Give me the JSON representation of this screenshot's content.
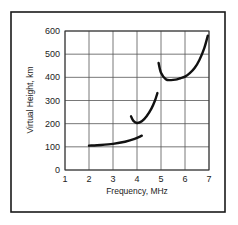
{
  "chart_data": {
    "type": "line",
    "title": "",
    "xlabel": "Frequency, MHz",
    "ylabel": "Virtual Height, km",
    "xlim": [
      1,
      7
    ],
    "ylim": [
      0,
      600
    ],
    "x_ticks": [
      "1",
      "2",
      "3",
      "4",
      "5",
      "6",
      "7"
    ],
    "y_ticks": [
      "0",
      "100",
      "200",
      "300",
      "400",
      "500",
      "600"
    ],
    "grid": true,
    "legend": null,
    "series": [
      {
        "name": "trace-1",
        "x": [
          2.0,
          2.5,
          3.0,
          3.5,
          3.9,
          4.2
        ],
        "y": [
          105,
          108,
          113,
          122,
          134,
          148
        ]
      },
      {
        "name": "trace-2",
        "x": [
          3.75,
          3.85,
          4.0,
          4.2,
          4.4,
          4.6,
          4.75,
          4.85
        ],
        "y": [
          232,
          212,
          203,
          210,
          232,
          265,
          300,
          332
        ]
      },
      {
        "name": "trace-3",
        "x": [
          4.9,
          5.0,
          5.2,
          5.4,
          5.6,
          5.8,
          6.0,
          6.2,
          6.4,
          6.6,
          6.8,
          6.95
        ],
        "y": [
          462,
          420,
          392,
          388,
          390,
          396,
          403,
          418,
          440,
          475,
          525,
          580
        ]
      }
    ]
  }
}
